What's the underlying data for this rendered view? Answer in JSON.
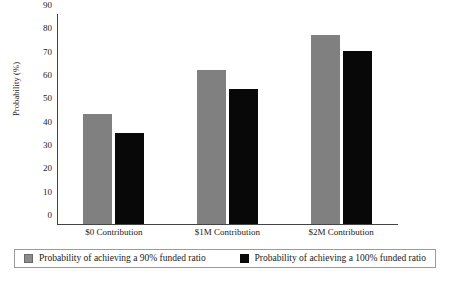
{
  "chart_data": {
    "type": "bar",
    "title": "",
    "subtitle": "",
    "xlabel": "",
    "ylabel": "Probability (%)",
    "categories": [
      "$0 Contribution",
      "$1M Contribution",
      "$2M Contribution"
    ],
    "series": [
      {
        "name": "Probability of achieving a 90% funded ratio",
        "color": "#808080",
        "values": [
          47,
          66,
          81
        ]
      },
      {
        "name": "Probability of achieving a 100% funded ratio",
        "color": "#080808",
        "values": [
          39,
          58,
          74
        ]
      }
    ],
    "ylim": [
      0,
      90
    ],
    "ytick_labels": [
      "90",
      "80",
      "70",
      "60",
      "50",
      "40",
      "30",
      "20",
      "10",
      "0"
    ],
    "ytick_values": [
      90,
      80,
      70,
      60,
      50,
      40,
      30,
      20,
      10,
      0
    ],
    "grid": false,
    "legend_position": "bottom"
  }
}
